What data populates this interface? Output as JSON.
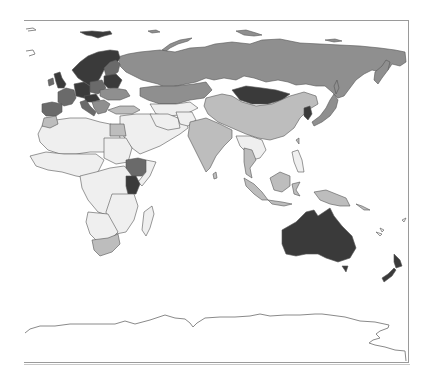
{
  "map": {
    "type": "choropleth",
    "region_view": "Eastern Hemisphere (Europe, Africa, Asia, Oceania)",
    "frame": {
      "left": 24,
      "top": 20,
      "right": 408,
      "bottom": 362
    },
    "palette": {
      "none": "#ffffff",
      "lowest": "#efefef",
      "low": "#bdbdbd",
      "mid": "#8f8f8f",
      "high": "#6a6a6a",
      "highest": "#3a3a3a",
      "border": "#555555",
      "frame": "#9a9a9a"
    },
    "regions": [
      {
        "name": "Russia",
        "shade": "mid"
      },
      {
        "name": "Scandinavia",
        "shade": "highest"
      },
      {
        "name": "Western Europe",
        "shade": "high"
      },
      {
        "name": "Belarus",
        "shade": "highest"
      },
      {
        "name": "Eastern Europe",
        "shade": "mid"
      },
      {
        "name": "Kazakhstan / Central Asia",
        "shade": "mid"
      },
      {
        "name": "Mongolia",
        "shade": "highest"
      },
      {
        "name": "China",
        "shade": "low"
      },
      {
        "name": "Korea",
        "shade": "highest"
      },
      {
        "name": "Japan",
        "shade": "mid"
      },
      {
        "name": "India",
        "shade": "low"
      },
      {
        "name": "Middle East",
        "shade": "lowest"
      },
      {
        "name": "Turkey",
        "shade": "low"
      },
      {
        "name": "North Africa",
        "shade": "lowest"
      },
      {
        "name": "Egypt",
        "shade": "low"
      },
      {
        "name": "Ethiopia",
        "shade": "high"
      },
      {
        "name": "Kenya",
        "shade": "highest"
      },
      {
        "name": "Sub-Saharan Africa",
        "shade": "lowest"
      },
      {
        "name": "South Africa",
        "shade": "low"
      },
      {
        "name": "Madagascar",
        "shade": "lowest"
      },
      {
        "name": "Southeast Asia",
        "shade": "low"
      },
      {
        "name": "Indonesia",
        "shade": "low"
      },
      {
        "name": "Papua New Guinea",
        "shade": "low"
      },
      {
        "name": "Australia",
        "shade": "highest"
      },
      {
        "name": "New Zealand",
        "shade": "highest"
      },
      {
        "name": "Antarctica",
        "shade": "none"
      }
    ]
  }
}
